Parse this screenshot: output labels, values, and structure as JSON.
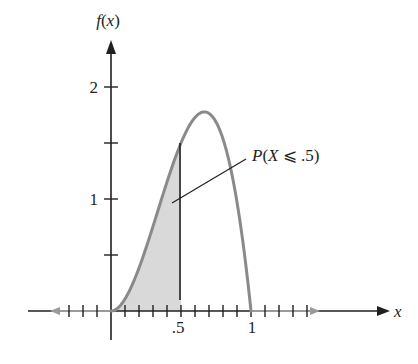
{
  "chart_data": {
    "type": "area",
    "title": "",
    "xlabel": "x",
    "ylabel": "f(x)",
    "function": "f(x) = 12x^2(1 - x), 0 <= x <= 1",
    "x_ticks": [
      "",
      ".5",
      "1"
    ],
    "x_tick_values": [
      0,
      0.5,
      1
    ],
    "x_minor_tick_step": 0.1,
    "y_ticks": [
      "1",
      "2"
    ],
    "y_tick_values": [
      1,
      2
    ],
    "y_minor_ticks": [
      0.5,
      1.5
    ],
    "xlim": [
      -0.6,
      1.8
    ],
    "ylim": [
      0,
      2.3
    ],
    "grid": false,
    "curve": {
      "x": [
        0,
        0.1,
        0.2,
        0.3,
        0.4,
        0.5,
        0.6,
        0.6667,
        0.7,
        0.8,
        0.9,
        1.0
      ],
      "y": [
        0,
        0.108,
        0.384,
        0.756,
        1.152,
        1.5,
        1.728,
        1.778,
        1.764,
        1.536,
        0.972,
        0
      ]
    },
    "shaded_region": {
      "from": 0,
      "to": 0.5,
      "label": "P(X ⩽ .5)"
    },
    "annotations": [
      {
        "text": "P(X ⩽ .5)",
        "points_to": "shaded region"
      }
    ],
    "colors": {
      "curve": "#8a8a8a",
      "shade": "#d9d9d9",
      "axis": "#231f20",
      "axis_highlight": "#9a9a9a"
    }
  },
  "labels": {
    "y_axis": "f(x)",
    "x_axis": "x",
    "x_tick_half": ".5",
    "x_tick_one": "1",
    "y_tick_one": "1",
    "y_tick_two": "2",
    "annotation": "P(X ⩽ .5)"
  }
}
